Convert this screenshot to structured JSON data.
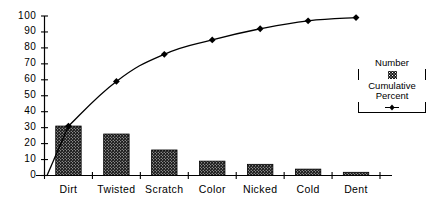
{
  "chart_data": {
    "type": "bar",
    "title": "",
    "subtitle": "",
    "xlabel": "",
    "ylabel": "",
    "categories": [
      "Dirt",
      "Twisted",
      "Scratch",
      "Color",
      "Nicked",
      "Cold",
      "Dent"
    ],
    "ylim": [
      0,
      100
    ],
    "yticks": [
      0,
      10,
      20,
      30,
      40,
      50,
      60,
      70,
      80,
      90,
      100
    ],
    "ytick_labels": [
      "0",
      "10",
      "20",
      "30",
      "40",
      "50",
      "60",
      "70",
      "80",
      "90",
      "100"
    ],
    "grid": false,
    "legend_position": "right",
    "series": [
      {
        "name": "Number",
        "type": "bar",
        "values": [
          31,
          26,
          16,
          9,
          7,
          4,
          2
        ]
      },
      {
        "name": "Cumulative Percent",
        "type": "line",
        "marker": "diamond",
        "values": [
          31,
          59,
          76,
          85,
          92,
          97,
          99
        ]
      }
    ],
    "annotations": []
  },
  "legend": {
    "number_label": "Number",
    "cumulative_label": "Cumulative",
    "percent_label": "Percent"
  },
  "colors": {
    "bar_fill": "#1a1a1a",
    "line": "#000000",
    "marker": "#000000",
    "axis": "#000000",
    "background": "#ffffff"
  }
}
